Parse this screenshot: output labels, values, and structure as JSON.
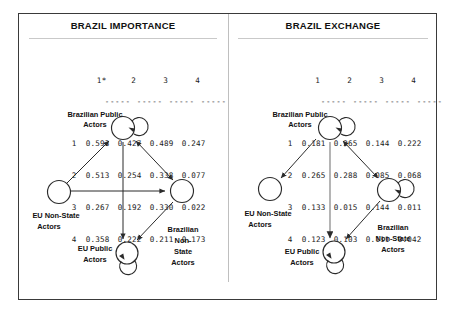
{
  "panels": {
    "left": {
      "title": "BRAZIL IMPORTANCE",
      "matrix": {
        "col_headers": [
          "1*",
          "2",
          "3",
          "4"
        ],
        "row_labels": [
          "1",
          "2",
          "3",
          "4"
        ],
        "separator": "-----",
        "rows": [
          [
            "0.593",
            "0.427",
            "0.489",
            "0.247"
          ],
          [
            "0.513",
            "0.254",
            "0.338",
            "0.077"
          ],
          [
            "0.267",
            "0.192",
            "0.330",
            "0.022"
          ],
          [
            "0.358",
            "0.222",
            "0.211",
            "0.173"
          ]
        ]
      },
      "graph": {
        "nodes": [
          {
            "id": "brazilian-public",
            "label": "Brazilian Public\nActors",
            "self_loop": true
          },
          {
            "id": "eu-non-state",
            "label": "EU Non-State\nActors",
            "self_loop": false
          },
          {
            "id": "brazilian-non-state",
            "label": "Brazilian\nNon-\nState\nActors",
            "self_loop": false
          },
          {
            "id": "eu-public",
            "label": "EU Public\nActors",
            "self_loop": true
          }
        ],
        "edges": [
          {
            "from": "eu-non-state",
            "to": "brazilian-public",
            "arrows": "single"
          },
          {
            "from": "eu-non-state",
            "to": "brazilian-non-state",
            "arrows": "single"
          },
          {
            "from": "brazilian-public",
            "to": "brazilian-non-state",
            "arrows": "double"
          },
          {
            "from": "brazilian-public",
            "to": "eu-public",
            "arrows": "single"
          },
          {
            "from": "brazilian-non-state",
            "to": "eu-public",
            "arrows": "single"
          }
        ]
      }
    },
    "right": {
      "title": "BRAZIL EXCHANGE",
      "matrix": {
        "col_headers": [
          "1",
          "2",
          "3",
          "4"
        ],
        "row_labels": [
          "1",
          "2",
          "3",
          "4"
        ],
        "separator": "-----",
        "rows": [
          [
            "0.181",
            "0.265",
            "0.144",
            "0.222"
          ],
          [
            "0.265",
            "0.288",
            "0.085",
            "0.068"
          ],
          [
            "0.133",
            "0.015",
            "0.144",
            "0.011"
          ],
          [
            "0.123",
            "0.103",
            "0.111",
            "0.042"
          ]
        ]
      },
      "graph": {
        "nodes": [
          {
            "id": "brazilian-public",
            "label": "Brazilian Public\nActors",
            "self_loop": true
          },
          {
            "id": "eu-non-state",
            "label": "EU Non-State\nActors",
            "self_loop": false
          },
          {
            "id": "brazilian-non-state",
            "label": "Brazilian\nNon-State\nActors",
            "self_loop": true
          },
          {
            "id": "eu-public",
            "label": "EU Public\nActors",
            "self_loop": true
          }
        ],
        "edges": [
          {
            "from": "brazilian-public",
            "to": "eu-non-state",
            "arrows": "single"
          },
          {
            "from": "brazilian-public",
            "to": "brazilian-non-state",
            "arrows": "double"
          },
          {
            "from": "brazilian-public",
            "to": "eu-public",
            "arrows": "single"
          },
          {
            "from": "brazilian-non-state",
            "to": "eu-public",
            "arrows": "single"
          }
        ]
      }
    }
  },
  "labels": {
    "brazilian_public_l1": "Brazilian Public",
    "brazilian_public_l2": "Actors",
    "eu_non_state_l1": "EU Non-State",
    "eu_non_state_l2": "Actors",
    "eu_public_l1": "EU Public",
    "eu_public_l2": "Actors",
    "bns_left_l1": "Brazilian",
    "bns_left_l2": "Non-",
    "bns_left_l3": "State",
    "bns_left_l4": "Actors",
    "bns_right_l1": "Brazilian",
    "bns_right_l2": "Non-State",
    "bns_right_l3": "Actors"
  },
  "colors": {
    "frame": "#3a3a3a",
    "rule": "#c9c9c9",
    "divider": "#bfbfbf",
    "ink": "#2b2b2b",
    "grey_edge": "#8d8d8d"
  }
}
